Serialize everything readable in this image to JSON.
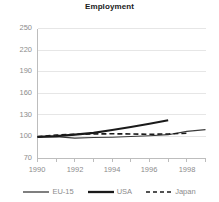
{
  "chart_data": {
    "type": "line",
    "title": "Employment",
    "xlabel": "",
    "ylabel": "",
    "xlim": [
      1990,
      1999
    ],
    "ylim": [
      70,
      250
    ],
    "yticks": [
      70,
      100,
      130,
      160,
      190,
      220,
      250
    ],
    "xticks": [
      1990,
      1992,
      1994,
      1996,
      1998
    ],
    "xminorticks": [
      1991,
      1993,
      1995,
      1997,
      1999
    ],
    "grid": "horizontal",
    "legend_position": "bottom",
    "index_base": 100,
    "series": [
      {
        "name": "EU-15",
        "style": "solid-thin",
        "color": "#3a3a3a",
        "x": [
          1990,
          1991,
          1992,
          1993,
          1994,
          1995,
          1996,
          1997,
          1998,
          1999
        ],
        "values": [
          100,
          100.3,
          98.2,
          99.0,
          99.5,
          100.5,
          101.5,
          103.0,
          107.5,
          110.0
        ]
      },
      {
        "name": "USA",
        "style": "solid-thick",
        "color": "#1a1a1a",
        "x": [
          1990,
          1991,
          1992,
          1993,
          1994,
          1995,
          1996,
          1997
        ],
        "values": [
          100,
          101.0,
          103.0,
          105.5,
          109.5,
          113.5,
          118.0,
          123.0
        ]
      },
      {
        "name": "Japan",
        "style": "dashed",
        "color": "#1a1a1a",
        "x": [
          1990,
          1991,
          1992,
          1993,
          1994,
          1995,
          1996,
          1997,
          1998
        ],
        "values": [
          100,
          102.5,
          103.5,
          104.0,
          104.2,
          104.0,
          103.5,
          104.0,
          105.0
        ]
      }
    ]
  },
  "axis": {
    "ytick_labels": [
      "250",
      "220",
      "190",
      "160",
      "130",
      "100",
      "70"
    ],
    "xtick_labels": [
      "1990",
      "1992",
      "1994",
      "1996",
      "1998"
    ]
  },
  "legend": {
    "items": [
      {
        "label": "EU-15",
        "swatch": "thin-line-icon"
      },
      {
        "label": "USA",
        "swatch": "thick-line-icon"
      },
      {
        "label": "Japan",
        "swatch": "dashed-line-icon"
      }
    ]
  },
  "colors": {
    "grid": "#e4e4e4",
    "axis": "#bdbdbd",
    "tick_text": "#8c8c8c",
    "title_text": "#1a1a1a",
    "series_eu": "#3a3a3a",
    "series_usa": "#1a1a1a",
    "series_japan": "#1a1a1a"
  }
}
